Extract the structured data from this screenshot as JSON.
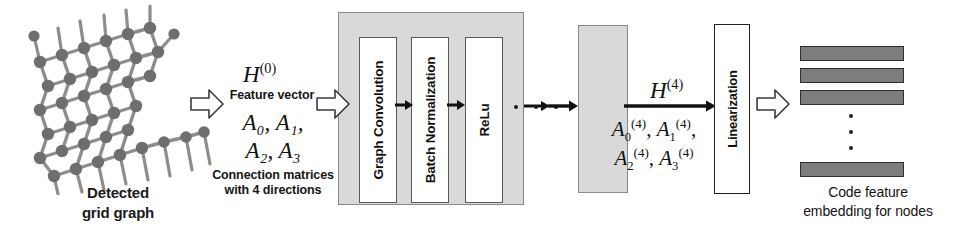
{
  "figure": {
    "type": "pipeline-diagram"
  },
  "input": {
    "icon": "grid-graph-illustration",
    "caption_line1": "Detected",
    "caption_line2": "grid graph",
    "node_color": "#6e6e6e",
    "edge_color": "#8a8a8a"
  },
  "arrows": {
    "input_to_features": "block-arrow-right",
    "features_to_gcn": "block-arrow-right",
    "linearization_to_output": "block-arrow-right",
    "flow_arrow": "arrow-right"
  },
  "features": {
    "h_symbol": "H",
    "h_superscript": "(0)",
    "h_caption": "Feature vector",
    "matrices_line1": "A₀, A₁,",
    "matrices_line2": "A₂, A₃",
    "matrix_symbols": [
      "A",
      "A",
      "A",
      "A"
    ],
    "matrix_subscripts": [
      "0",
      "1",
      "2",
      "3"
    ],
    "matrices_caption_line1": "Connection matrices",
    "matrices_caption_line2": "with 4 directions"
  },
  "gcn_block": {
    "container_color": "#d9d9d9",
    "layers": [
      {
        "label": "Graph Convolution"
      },
      {
        "label": "Batch Normalization"
      },
      {
        "label": "ReLu"
      }
    ]
  },
  "repeat": {
    "ellipsis_dots": 3,
    "tail_block_label": "",
    "tail_block_color": "#d9d9d9"
  },
  "output_features": {
    "h_symbol": "H",
    "h_superscript": "(4)",
    "matrices_line1": "A₀⁽⁴⁾, A₁⁽⁴⁾,",
    "matrices_line2": "A₂⁽⁴⁾, A₃⁽⁴⁾",
    "matrix_symbols": [
      "A",
      "A",
      "A",
      "A"
    ],
    "matrix_subscripts": [
      "0",
      "1",
      "2",
      "3"
    ],
    "matrix_superscript": "(4)"
  },
  "linearization": {
    "label": "Linearization"
  },
  "output": {
    "bar_count_visible": 4,
    "ellipsis_dots": 3,
    "bar_color": "#7d7d7d",
    "caption_line1": "Code feature",
    "caption_line2": "embedding for nodes"
  }
}
